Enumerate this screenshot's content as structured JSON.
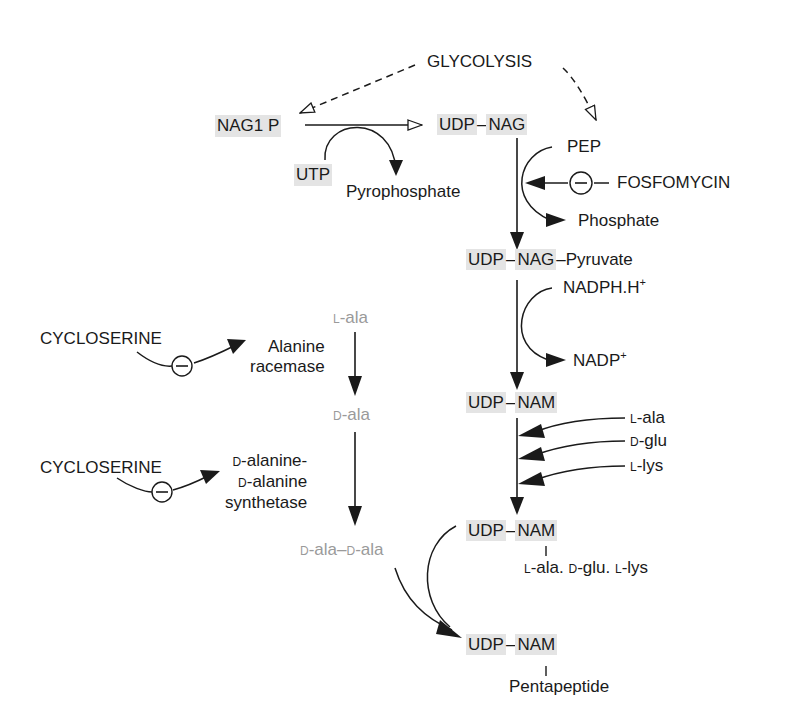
{
  "diagram": {
    "nodes": {
      "glycolysis": "GLYCOLYSIS",
      "nag1p": "NAG1 P",
      "udp_nag_udp": "UDP",
      "udp_nag_dash": "–",
      "udp_nag_nag": "NAG",
      "utp": "UTP",
      "pyrophosphate": "Pyrophosphate",
      "pep": "PEP",
      "fosfomycin": "FOSFOMYCIN",
      "phosphate": "Phosphate",
      "udp_nag_pyr_udp": "UDP",
      "udp_nag_pyr_dash": "–",
      "udp_nag_pyr_nag": "NAG",
      "udp_nag_pyr_tail": "–Pyruvate",
      "nadph": "NADPH.H",
      "nadph_sup": "+",
      "nadp": "NADP",
      "nadp_sup": "+",
      "udp_nam1_udp": "UDP",
      "udp_nam1_dash": "–",
      "udp_nam1_nam": "NAM",
      "l_ala_prefix": "L",
      "l_ala": "-ala",
      "d_glu_prefix": "D",
      "d_glu": "-glu",
      "l_lys_prefix": "L",
      "l_lys": "-lys",
      "udp_nam2_udp": "UDP",
      "udp_nam2_dash": "–",
      "udp_nam2_nam": "NAM",
      "tripeptide": {
        "p1": "L",
        "t1": "-ala. ",
        "p2": "D",
        "t2": "-glu. ",
        "p3": "L",
        "t3": "-lys"
      },
      "udp_nam3_udp": "UDP",
      "udp_nam3_dash": "–",
      "udp_nam3_nam": "NAM",
      "pentapeptide": "Pentapeptide",
      "cycloserine1": "CYCLOSERINE",
      "alanine_racemase_l1": "Alanine",
      "alanine_racemase_l2": "racemase",
      "cycloserine2": "CYCLOSERINE",
      "ddl_l1_prefix": "D",
      "ddl_l1": "-alanine-",
      "ddl_l2_prefix": "D",
      "ddl_l2": "-alanine",
      "ddl_l3": "synthetase",
      "left_l_ala_prefix": "L",
      "left_l_ala": "-ala",
      "left_d_ala_prefix": "D",
      "left_d_ala": "-ala",
      "dala_dala": {
        "p1": "D",
        "t1": "-ala–",
        "p2": "D",
        "t2": "-ala"
      }
    },
    "inhibitor_symbol": "−",
    "colors": {
      "highlight": "#e4e4e4",
      "ink": "#1a1a1a",
      "gray_text": "#9a9a9a"
    }
  }
}
